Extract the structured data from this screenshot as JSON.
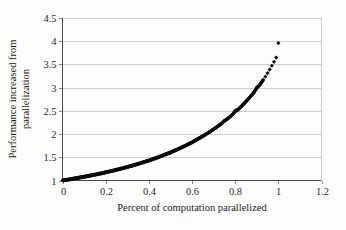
{
  "chart_data": {
    "type": "scatter",
    "title": "",
    "xlabel": "Percent of computation parallelized",
    "ylabel_line1": "Performance increased from",
    "ylabel_line2": "parallelization",
    "ylabel": "Performance increased from parallelization",
    "xlim": [
      0,
      1.2
    ],
    "ylim": [
      1,
      4.5
    ],
    "grid": true,
    "grid_axis": "y",
    "legend": "none",
    "marker": "diamond",
    "marker_color": "#0d0d0d",
    "xticks": [
      0,
      0.2,
      0.4,
      0.6,
      0.8,
      1,
      1.2
    ],
    "xtick_labels": [
      "0",
      "0.2",
      "0.4",
      "0.6",
      "0.8",
      "1",
      "1.2"
    ],
    "yticks": [
      1,
      1.5,
      2,
      2.5,
      3,
      3.5,
      4,
      4.5
    ],
    "ytick_labels": [
      "1",
      "1.5",
      "2",
      "2.5",
      "3",
      "3.5",
      "4",
      "4.5"
    ],
    "series": [
      {
        "name": "Amdahl speedup (4 processors)",
        "x": [
          0,
          0.01,
          0.02,
          0.03,
          0.04,
          0.05,
          0.06,
          0.07,
          0.08,
          0.09,
          0.1,
          0.11,
          0.12,
          0.13,
          0.14,
          0.15,
          0.16,
          0.17,
          0.18,
          0.19,
          0.2,
          0.21,
          0.22,
          0.23,
          0.24,
          0.25,
          0.26,
          0.27,
          0.28,
          0.29,
          0.3,
          0.31,
          0.32,
          0.33,
          0.34,
          0.35,
          0.36,
          0.37,
          0.38,
          0.39,
          0.4,
          0.41,
          0.42,
          0.43,
          0.44,
          0.45,
          0.46,
          0.47,
          0.48,
          0.49,
          0.5,
          0.51,
          0.52,
          0.53,
          0.54,
          0.55,
          0.56,
          0.57,
          0.58,
          0.59,
          0.6,
          0.61,
          0.62,
          0.63,
          0.64,
          0.65,
          0.66,
          0.67,
          0.68,
          0.69,
          0.7,
          0.71,
          0.72,
          0.73,
          0.74,
          0.75,
          0.76,
          0.77,
          0.78,
          0.79,
          0.8,
          0.81,
          0.82,
          0.83,
          0.84,
          0.85,
          0.86,
          0.87,
          0.88,
          0.89,
          0.9,
          0.91,
          0.92,
          0.93,
          0.94,
          0.95,
          0.96,
          0.97,
          0.98,
          0.99,
          1
        ],
        "y": [
          1.0,
          1.008,
          1.015,
          1.023,
          1.031,
          1.039,
          1.047,
          1.055,
          1.064,
          1.072,
          1.081,
          1.089,
          1.098,
          1.107,
          1.116,
          1.126,
          1.135,
          1.145,
          1.155,
          1.165,
          1.176,
          1.186,
          1.197,
          1.208,
          1.219,
          1.231,
          1.242,
          1.254,
          1.266,
          1.279,
          1.29,
          1.304,
          1.316,
          1.33,
          1.344,
          1.358,
          1.372,
          1.386,
          1.401,
          1.416,
          1.429,
          1.447,
          1.463,
          1.479,
          1.496,
          1.513,
          1.531,
          1.549,
          1.567,
          1.586,
          1.6,
          1.625,
          1.645,
          1.665,
          1.686,
          1.708,
          1.73,
          1.752,
          1.775,
          1.799,
          1.818,
          1.848,
          1.873,
          1.9,
          1.927,
          1.954,
          1.983,
          2.012,
          2.041,
          2.072,
          2.105,
          2.135,
          2.169,
          2.203,
          2.238,
          2.286,
          2.312,
          2.35,
          2.389,
          2.43,
          2.5,
          2.515,
          2.558,
          2.604,
          2.651,
          2.7,
          2.751,
          2.804,
          2.858,
          2.915,
          3.0,
          3.036,
          3.101,
          3.168,
          3.239,
          3.313,
          3.39,
          3.472,
          3.557,
          3.647,
          3.96
        ]
      }
    ]
  },
  "axis": {
    "y_label_line1": "Performance increased from",
    "y_label_line2": "parallelization",
    "x_label": "Percent of computation parallelized"
  }
}
